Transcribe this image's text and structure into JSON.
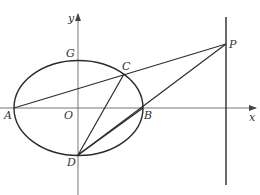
{
  "figure": {
    "colors": {
      "stroke": "#2b2b2b",
      "axis": "#555555",
      "label": "#333333",
      "background": "#ffffff"
    }
  },
  "axes": {
    "x_label": "x",
    "y_label": "y",
    "origin_label": "O"
  },
  "points": {
    "A": {
      "label": "A",
      "x": 14,
      "y": 108
    },
    "B": {
      "label": "B",
      "x": 143,
      "y": 108
    },
    "C": {
      "label": "C",
      "x": 124,
      "y": 74
    },
    "D": {
      "label": "D",
      "x": 78,
      "y": 155
    },
    "G": {
      "label": "G",
      "x": 78,
      "y": 60
    },
    "O": {
      "label": "O",
      "x": 78,
      "y": 108
    },
    "P": {
      "label": "P",
      "x": 226,
      "y": 44
    }
  },
  "ellipse": {
    "cx": 78.5,
    "cy": 108,
    "rx": 64.5,
    "ry": 47.5
  },
  "vertical_line": {
    "x": 226,
    "y1": 17,
    "y2": 185
  },
  "segments": [
    {
      "from": "A",
      "to": "P"
    },
    {
      "from": "D",
      "to": "P"
    },
    {
      "from": "D",
      "to": "C"
    },
    {
      "from": "D",
      "to": "B"
    }
  ]
}
